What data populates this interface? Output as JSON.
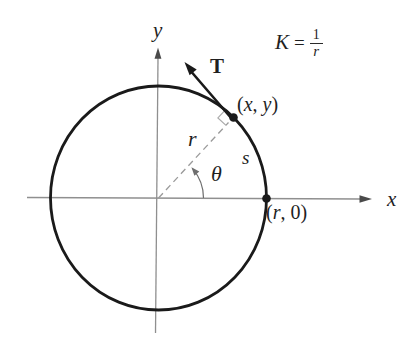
{
  "figure": {
    "description_colors": {
      "ink": "#1a1a1a",
      "axis_gray": "#8f8f8f",
      "dash_gray": "#9a9a9a",
      "mark_gray": "#ababab",
      "background": "#ffffff"
    },
    "formula": {
      "lhs": "K",
      "eq": "=",
      "num": "1",
      "den": "r"
    },
    "axes": {
      "x_label": "x",
      "y_label": "y"
    },
    "labels": {
      "tangent_vector": "T",
      "radius": "r",
      "angle": "θ",
      "arc_length": "s"
    },
    "points": {
      "xy": {
        "open": "(",
        "first": "x",
        "sep": ", ",
        "second": "y",
        "close": ")"
      },
      "r0": {
        "open": "(",
        "first": "r",
        "sep": ", ",
        "second": "0",
        "close": ")"
      }
    }
  }
}
